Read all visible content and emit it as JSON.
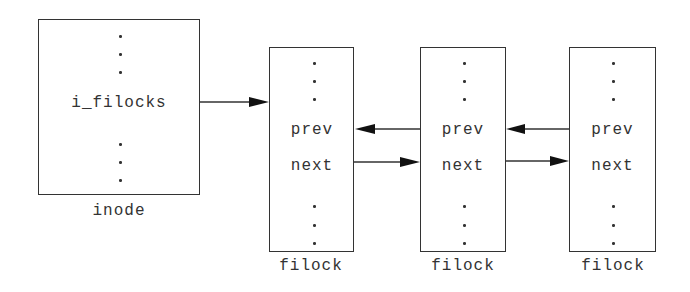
{
  "diagram": {
    "inode": {
      "field": "i_filocks",
      "label": "inode"
    },
    "filocks": [
      {
        "prev": "prev",
        "next": "next",
        "label": "filock"
      },
      {
        "prev": "prev",
        "next": "next",
        "label": "filock"
      },
      {
        "prev": "prev",
        "next": "next",
        "label": "filock"
      }
    ],
    "arrows": [
      {
        "from": "inode.i_filocks",
        "to": "filock[0]"
      },
      {
        "from": "filock[0].next",
        "to": "filock[1]"
      },
      {
        "from": "filock[1].prev",
        "to": "filock[0]"
      },
      {
        "from": "filock[1].next",
        "to": "filock[2]"
      },
      {
        "from": "filock[2].prev",
        "to": "filock[1]"
      }
    ],
    "colors": {
      "line": "#333333",
      "background": "#ffffff"
    }
  }
}
